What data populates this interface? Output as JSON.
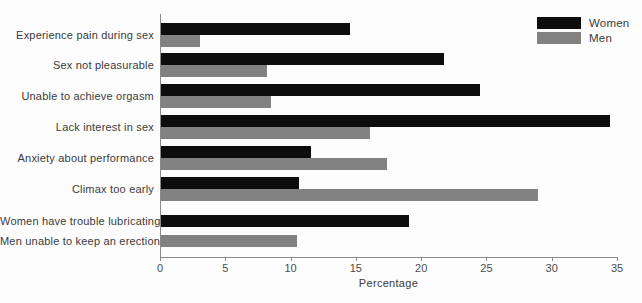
{
  "chart_data": {
    "type": "bar",
    "orientation": "horizontal",
    "title": "",
    "xlabel": "Percentage",
    "xlim": [
      0,
      35
    ],
    "xticks": [
      0,
      5,
      10,
      15,
      20,
      25,
      30,
      35
    ],
    "grid": false,
    "legend_position": "top-right",
    "categories": [
      "Experience pain during sex",
      "Sex not pleasurable",
      "Unable to achieve orgasm",
      "Lack interest in sex",
      "Anxiety about performance",
      "Climax too early",
      "Women have trouble lubricating",
      "Men unable to keep an erection"
    ],
    "series": [
      {
        "name": "Women",
        "color": "#0d0d0d",
        "values": [
          14.5,
          21.7,
          24.4,
          34.4,
          11.5,
          10.6,
          19.0,
          null
        ]
      },
      {
        "name": "Men",
        "color": "#818181",
        "values": [
          3.0,
          8.1,
          8.4,
          16.0,
          17.3,
          28.9,
          null,
          10.4
        ]
      }
    ]
  },
  "colors": {
    "background": "#fdfdfd",
    "axis": "#8a8a8a",
    "category_text": "#3b3b3b",
    "tick_text": "#4c4c4c",
    "women_bar": "#0d0d0d",
    "men_bar": "#818181"
  }
}
